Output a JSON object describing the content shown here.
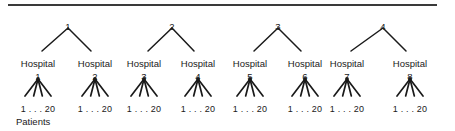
{
  "figure": {
    "background_color": "#ffffff",
    "line_color": "#1a1a1a",
    "text_color": "#1a1a1a",
    "rule": {
      "x": 8,
      "y": 4,
      "width": 429,
      "height": 1.6,
      "color": "#3a3a3a"
    },
    "caption": "Patients",
    "caption_x": 16,
    "caption_y": 117,
    "levels": {
      "top_label_y": 22,
      "top_apex_y": 28,
      "hospital_word_y": 59,
      "hospital_num_y": 72,
      "fan_apex_y": 79,
      "fan_base_y": 96,
      "patient_range_y": 105
    }
  },
  "top_nodes": [
    {
      "label": "1",
      "x": 68,
      "apex_x": 68,
      "left_child_x": 38,
      "right_child_x": 95
    },
    {
      "label": "2",
      "x": 172,
      "apex_x": 172,
      "left_child_x": 144,
      "right_child_x": 198
    },
    {
      "label": "3",
      "x": 278,
      "apex_x": 278,
      "left_child_x": 250,
      "right_child_x": 305
    },
    {
      "label": "4",
      "x": 383,
      "apex_x": 383,
      "left_child_x": 347,
      "right_child_x": 410
    }
  ],
  "hospitals": [
    {
      "word": "Hospital",
      "number": "1",
      "x": 38,
      "patients": "1 . . . 20"
    },
    {
      "word": "Hospital",
      "number": "2",
      "x": 95,
      "patients": "1 . . . 20"
    },
    {
      "word": "Hospital",
      "number": "3",
      "x": 144,
      "patients": "1 . . . 20"
    },
    {
      "word": "Hospital",
      "number": "4",
      "x": 198,
      "patients": "1 . . . 20"
    },
    {
      "word": "Hospital",
      "number": "5",
      "x": 250,
      "patients": "1 . . . 20"
    },
    {
      "word": "Hospital",
      "number": "6",
      "x": 305,
      "patients": "1 . . . 20"
    },
    {
      "word": "Hospital",
      "number": "7",
      "x": 347,
      "patients": "1 . . . 20"
    },
    {
      "word": "Hospital",
      "number": "8",
      "x": 410,
      "patients": "1 . . . 20"
    }
  ],
  "fan": {
    "branches_per_hospital": 4,
    "half_width": 13
  }
}
